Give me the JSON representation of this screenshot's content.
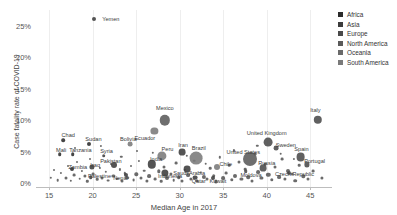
{
  "chart_data": {
    "type": "scatter",
    "title": "",
    "xlabel": "Median Age in 2017",
    "ylabel": "Case fatality rate of COVID-19",
    "xlim": [
      13.5,
      47.5
    ],
    "ylim": [
      -0.6,
      27.5
    ],
    "xticks": [
      15,
      20,
      25,
      30,
      35,
      40,
      45
    ],
    "xtick_labels": [
      "15",
      "20",
      "25",
      "30",
      "35",
      "40",
      "45"
    ],
    "yticks": [
      0,
      5,
      10,
      15,
      20,
      25
    ],
    "ytick_labels": [
      "0%",
      "5%",
      "10%",
      "15%",
      "20%",
      "25%"
    ],
    "grid": "vertical-only",
    "legend_position": "right",
    "bubble_size_note": "marker area scales with number of confirmed cases",
    "series": [
      {
        "name": "Africa",
        "color": "#2b2b2b"
      },
      {
        "name": "Asia",
        "color": "#3c3c3c"
      },
      {
        "name": "Europe",
        "color": "#4a4a4a"
      },
      {
        "name": "North America",
        "color": "#5a5a5a"
      },
      {
        "name": "Oceania",
        "color": "#6a6a6a"
      },
      {
        "name": "South America",
        "color": "#7a7a7a"
      }
    ],
    "points": [
      {
        "label": "Yemen",
        "x": 20.2,
        "y": 26.0,
        "r": 2.0,
        "region": "Asia",
        "lx": 22.1,
        "ly": 26.0
      },
      {
        "label": "Mexico",
        "x": 28.3,
        "y": 10.0,
        "r": 5.2,
        "region": "North America",
        "lx": 28.3,
        "ly": 11.9
      },
      {
        "label": "Ecuador",
        "x": 27.1,
        "y": 8.3,
        "r": 3.6,
        "region": "South America",
        "lx": 26.0,
        "ly": 7.1
      },
      {
        "label": "Italy",
        "x": 45.9,
        "y": 10.1,
        "r": 4.2,
        "region": "Europe",
        "lx": 45.6,
        "ly": 11.6
      },
      {
        "label": "United Kingdom",
        "x": 40.2,
        "y": 6.5,
        "r": 4.4,
        "region": "Europe",
        "lx": 40.0,
        "ly": 7.9
      },
      {
        "label": "Sweden",
        "x": 41.1,
        "y": 5.6,
        "r": 2.4,
        "region": "Europe",
        "lx": 42.2,
        "ly": 6.1
      },
      {
        "label": "Spain",
        "x": 43.9,
        "y": 4.2,
        "r": 4.4,
        "region": "Europe",
        "lx": 44.0,
        "ly": 5.5
      },
      {
        "label": "Portugal",
        "x": 44.6,
        "y": 3.0,
        "r": 2.6,
        "region": "Europe",
        "lx": 45.5,
        "ly": 3.5
      },
      {
        "label": "Czech Republic",
        "x": 42.6,
        "y": 1.6,
        "r": 2.0,
        "region": "Europe",
        "lx": 43.2,
        "ly": 1.5
      },
      {
        "label": "United States",
        "x": 38.1,
        "y": 3.8,
        "r": 7.0,
        "region": "North America",
        "lx": 37.3,
        "ly": 5.0
      },
      {
        "label": "Russia",
        "x": 39.6,
        "y": 2.4,
        "r": 3.4,
        "region": "Europe",
        "lx": 40.0,
        "ly": 3.2
      },
      {
        "label": "Moldova",
        "x": 37.6,
        "y": 1.9,
        "r": 1.8,
        "region": "Europe",
        "lx": 38.2,
        "ly": 1.3
      },
      {
        "label": "Brazil",
        "x": 31.9,
        "y": 4.0,
        "r": 6.4,
        "region": "South America",
        "lx": 32.2,
        "ly": 5.6
      },
      {
        "label": "Chile",
        "x": 34.3,
        "y": 2.6,
        "r": 3.0,
        "region": "South America",
        "lx": 35.3,
        "ly": 3.1
      },
      {
        "label": "Saudi Arabia",
        "x": 30.9,
        "y": 2.3,
        "r": 3.4,
        "region": "Asia",
        "lx": 31.1,
        "ly": 1.6
      },
      {
        "label": "Qatar",
        "x": 31.8,
        "y": 0.9,
        "r": 2.4,
        "region": "Asia",
        "lx": 32.2,
        "ly": 0.3
      },
      {
        "label": "Kuwait",
        "x": 33.8,
        "y": 0.9,
        "r": 2.0,
        "region": "Asia",
        "lx": 34.4,
        "ly": 0.4
      },
      {
        "label": "Peru",
        "x": 28.0,
        "y": 4.4,
        "r": 4.6,
        "region": "South America",
        "lx": 28.6,
        "ly": 5.4
      },
      {
        "label": "Iran",
        "x": 30.3,
        "y": 5.0,
        "r": 3.4,
        "region": "Asia",
        "lx": 30.4,
        "ly": 6.1
      },
      {
        "label": "India",
        "x": 26.8,
        "y": 3.0,
        "r": 4.2,
        "region": "Asia",
        "lx": 27.3,
        "ly": 3.8
      },
      {
        "label": "Indonesia",
        "x": 28.3,
        "y": 1.7,
        "r": 3.6,
        "region": "Asia",
        "lx": 28.9,
        "ly": 1.2
      },
      {
        "label": "Bolivia",
        "x": 24.3,
        "y": 6.2,
        "r": 2.4,
        "region": "South America",
        "lx": 24.1,
        "ly": 7.0
      },
      {
        "label": "Pakistan",
        "x": 22.5,
        "y": 2.9,
        "r": 3.0,
        "region": "Asia",
        "lx": 22.1,
        "ly": 3.5
      },
      {
        "label": "Nepal",
        "x": 23.8,
        "y": 1.3,
        "r": 2.0,
        "region": "Asia",
        "lx": 23.2,
        "ly": 0.9
      },
      {
        "label": "Chad",
        "x": 16.6,
        "y": 6.8,
        "r": 1.8,
        "region": "Africa",
        "lx": 17.2,
        "ly": 7.6
      },
      {
        "label": "Sudan",
        "x": 19.6,
        "y": 6.3,
        "r": 2.0,
        "region": "Africa",
        "lx": 20.1,
        "ly": 7.0
      },
      {
        "label": "Mali",
        "x": 16.2,
        "y": 4.6,
        "r": 1.8,
        "region": "Africa",
        "lx": 16.4,
        "ly": 5.3
      },
      {
        "label": "Tanzania",
        "x": 17.7,
        "y": 4.6,
        "r": 1.8,
        "region": "Africa",
        "lx": 18.6,
        "ly": 5.3
      },
      {
        "label": "Syria",
        "x": 21.3,
        "y": 4.4,
        "r": 1.8,
        "region": "Asia",
        "lx": 21.6,
        "ly": 5.1
      },
      {
        "label": "Zambia",
        "x": 17.6,
        "y": 2.3,
        "r": 2.0,
        "region": "Africa",
        "lx": 18.3,
        "ly": 2.6
      },
      {
        "label": "Iraq",
        "x": 19.9,
        "y": 2.6,
        "r": 2.6,
        "region": "Asia",
        "lx": 20.3,
        "ly": 2.9
      },
      {
        "label": "Palestine",
        "x": 19.8,
        "y": 1.0,
        "r": 1.8,
        "region": "Asia",
        "lx": 20.8,
        "ly": 1.1
      }
    ],
    "background_points": [
      {
        "x": 15.2,
        "y": 0.9,
        "r": 1.2
      },
      {
        "x": 15.6,
        "y": 2.1,
        "r": 1.0
      },
      {
        "x": 16.0,
        "y": 0.5,
        "r": 1.3
      },
      {
        "x": 16.4,
        "y": 1.6,
        "r": 1.1
      },
      {
        "x": 16.9,
        "y": 0.8,
        "r": 1.5
      },
      {
        "x": 17.2,
        "y": 2.8,
        "r": 1.0
      },
      {
        "x": 17.5,
        "y": 0.4,
        "r": 1.2
      },
      {
        "x": 17.9,
        "y": 1.3,
        "r": 1.4
      },
      {
        "x": 18.2,
        "y": 3.3,
        "r": 1.0
      },
      {
        "x": 18.5,
        "y": 0.7,
        "r": 1.3
      },
      {
        "x": 18.8,
        "y": 2.0,
        "r": 1.1
      },
      {
        "x": 19.1,
        "y": 1.1,
        "r": 1.6
      },
      {
        "x": 19.4,
        "y": 0.3,
        "r": 1.2
      },
      {
        "x": 19.7,
        "y": 3.9,
        "r": 1.0
      },
      {
        "x": 20.1,
        "y": 1.5,
        "r": 1.4
      },
      {
        "x": 20.5,
        "y": 0.6,
        "r": 1.3
      },
      {
        "x": 20.8,
        "y": 2.4,
        "r": 1.1
      },
      {
        "x": 21.1,
        "y": 0.9,
        "r": 1.5
      },
      {
        "x": 21.5,
        "y": 1.8,
        "r": 1.2
      },
      {
        "x": 21.8,
        "y": 0.4,
        "r": 1.4
      },
      {
        "x": 22.1,
        "y": 3.0,
        "r": 1.0
      },
      {
        "x": 22.4,
        "y": 1.2,
        "r": 1.6
      },
      {
        "x": 22.8,
        "y": 0.7,
        "r": 1.3
      },
      {
        "x": 23.1,
        "y": 2.2,
        "r": 1.1
      },
      {
        "x": 23.4,
        "y": 0.3,
        "r": 1.5
      },
      {
        "x": 23.7,
        "y": 1.6,
        "r": 1.2
      },
      {
        "x": 24.0,
        "y": 0.9,
        "r": 1.8
      },
      {
        "x": 24.4,
        "y": 2.7,
        "r": 1.0
      },
      {
        "x": 24.7,
        "y": 0.5,
        "r": 1.4
      },
      {
        "x": 25.0,
        "y": 1.4,
        "r": 1.7
      },
      {
        "x": 25.3,
        "y": 3.5,
        "r": 1.1
      },
      {
        "x": 25.6,
        "y": 0.8,
        "r": 1.5
      },
      {
        "x": 25.9,
        "y": 2.0,
        "r": 1.3
      },
      {
        "x": 26.2,
        "y": 0.4,
        "r": 1.6
      },
      {
        "x": 26.5,
        "y": 1.1,
        "r": 1.9
      },
      {
        "x": 26.9,
        "y": 4.8,
        "r": 1.2
      },
      {
        "x": 27.2,
        "y": 0.6,
        "r": 1.4
      },
      {
        "x": 27.6,
        "y": 1.9,
        "r": 1.7
      },
      {
        "x": 27.9,
        "y": 0.3,
        "r": 1.3
      },
      {
        "x": 28.2,
        "y": 2.6,
        "r": 1.5
      },
      {
        "x": 28.6,
        "y": 0.9,
        "r": 2.0
      },
      {
        "x": 29.0,
        "y": 1.5,
        "r": 1.6
      },
      {
        "x": 29.3,
        "y": 0.5,
        "r": 1.3
      },
      {
        "x": 29.6,
        "y": 3.2,
        "r": 1.4
      },
      {
        "x": 29.9,
        "y": 1.0,
        "r": 1.8
      },
      {
        "x": 30.3,
        "y": 0.3,
        "r": 1.5
      },
      {
        "x": 30.6,
        "y": 2.1,
        "r": 1.2
      },
      {
        "x": 31.0,
        "y": 1.3,
        "r": 1.9
      },
      {
        "x": 31.3,
        "y": 0.7,
        "r": 1.6
      },
      {
        "x": 31.7,
        "y": 3.6,
        "r": 1.3
      },
      {
        "x": 32.0,
        "y": 0.4,
        "r": 1.7
      },
      {
        "x": 32.4,
        "y": 1.7,
        "r": 1.4
      },
      {
        "x": 32.8,
        "y": 1.0,
        "r": 2.1
      },
      {
        "x": 33.1,
        "y": 0.6,
        "r": 1.5
      },
      {
        "x": 33.5,
        "y": 2.4,
        "r": 1.3
      },
      {
        "x": 33.9,
        "y": 1.2,
        "r": 1.8
      },
      {
        "x": 34.2,
        "y": 0.3,
        "r": 1.6
      },
      {
        "x": 34.6,
        "y": 4.1,
        "r": 1.2
      },
      {
        "x": 35.0,
        "y": 0.8,
        "r": 1.9
      },
      {
        "x": 35.3,
        "y": 1.6,
        "r": 1.4
      },
      {
        "x": 35.7,
        "y": 2.9,
        "r": 1.3
      },
      {
        "x": 36.0,
        "y": 0.5,
        "r": 1.7
      },
      {
        "x": 36.4,
        "y": 1.2,
        "r": 2.0
      },
      {
        "x": 36.8,
        "y": 3.4,
        "r": 1.5
      },
      {
        "x": 37.1,
        "y": 0.7,
        "r": 1.6
      },
      {
        "x": 37.5,
        "y": 2.2,
        "r": 1.3
      },
      {
        "x": 37.9,
        "y": 1.0,
        "r": 1.8
      },
      {
        "x": 38.3,
        "y": 0.4,
        "r": 1.5
      },
      {
        "x": 38.7,
        "y": 4.6,
        "r": 1.4
      },
      {
        "x": 39.0,
        "y": 1.8,
        "r": 1.9
      },
      {
        "x": 39.4,
        "y": 0.9,
        "r": 1.6
      },
      {
        "x": 39.8,
        "y": 3.0,
        "r": 1.3
      },
      {
        "x": 40.2,
        "y": 1.3,
        "r": 2.2
      },
      {
        "x": 40.6,
        "y": 0.5,
        "r": 1.7
      },
      {
        "x": 41.0,
        "y": 2.6,
        "r": 1.5
      },
      {
        "x": 41.4,
        "y": 1.0,
        "r": 1.9
      },
      {
        "x": 41.8,
        "y": 3.8,
        "r": 1.4
      },
      {
        "x": 42.1,
        "y": 0.7,
        "r": 1.6
      },
      {
        "x": 42.5,
        "y": 2.0,
        "r": 2.0
      },
      {
        "x": 42.9,
        "y": 1.4,
        "r": 1.5
      },
      {
        "x": 43.3,
        "y": 0.4,
        "r": 1.8
      },
      {
        "x": 43.7,
        "y": 2.9,
        "r": 1.3
      },
      {
        "x": 44.2,
        "y": 1.1,
        "r": 1.7
      },
      {
        "x": 44.8,
        "y": 0.6,
        "r": 1.5
      },
      {
        "x": 45.3,
        "y": 1.9,
        "r": 1.4
      },
      {
        "x": 46.3,
        "y": 0.8,
        "r": 1.6
      },
      {
        "x": 18.0,
        "y": 5.6,
        "r": 1.0
      },
      {
        "x": 21.0,
        "y": 5.9,
        "r": 1.1
      },
      {
        "x": 23.3,
        "y": 4.2,
        "r": 1.2
      },
      {
        "x": 25.1,
        "y": 5.1,
        "r": 1.0
      },
      {
        "x": 30.8,
        "y": 4.4,
        "r": 1.2
      },
      {
        "x": 33.0,
        "y": 3.1,
        "r": 1.3
      },
      {
        "x": 36.2,
        "y": 5.2,
        "r": 1.1
      },
      {
        "x": 38.9,
        "y": 5.9,
        "r": 1.2
      },
      {
        "x": 41.6,
        "y": 4.7,
        "r": 1.3
      },
      {
        "x": 43.1,
        "y": 3.9,
        "r": 1.1
      }
    ]
  }
}
